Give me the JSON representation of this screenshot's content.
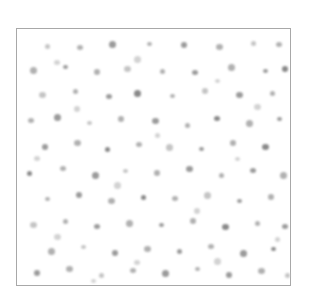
{
  "image": {
    "description": "Square frame filled with a random scatter of soft gray dots",
    "frame": {
      "left": 16,
      "top": 28,
      "width": 275,
      "height": 258,
      "border_color": "#a8a8a8"
    },
    "dot_colors": [
      "#c4c4c4",
      "#b0b0b0",
      "#9a9a9a",
      "#888888",
      "#d2d2d2"
    ],
    "dots": [
      [
        30,
        17,
        0
      ],
      [
        63,
        19,
        1
      ],
      [
        95,
        15,
        2
      ],
      [
        132,
        15,
        1
      ],
      [
        167,
        16,
        2
      ],
      [
        202,
        18,
        1
      ],
      [
        236,
        14,
        0
      ],
      [
        262,
        16,
        1
      ],
      [
        16,
        41,
        1
      ],
      [
        48,
        38,
        2
      ],
      [
        80,
        43,
        1
      ],
      [
        110,
        40,
        0
      ],
      [
        145,
        42,
        1
      ],
      [
        178,
        44,
        2
      ],
      [
        214,
        38,
        1
      ],
      [
        248,
        42,
        2
      ],
      [
        268,
        40,
        3
      ],
      [
        25,
        66,
        0
      ],
      [
        58,
        62,
        1
      ],
      [
        92,
        68,
        2
      ],
      [
        120,
        64,
        3
      ],
      [
        155,
        67,
        1
      ],
      [
        188,
        62,
        0
      ],
      [
        222,
        66,
        2
      ],
      [
        255,
        64,
        1
      ],
      [
        14,
        92,
        1
      ],
      [
        40,
        88,
        2
      ],
      [
        72,
        94,
        0
      ],
      [
        104,
        90,
        1
      ],
      [
        138,
        92,
        2
      ],
      [
        170,
        96,
        1
      ],
      [
        200,
        90,
        3
      ],
      [
        232,
        94,
        1
      ],
      [
        262,
        90,
        2
      ],
      [
        28,
        118,
        2
      ],
      [
        60,
        114,
        1
      ],
      [
        90,
        120,
        3
      ],
      [
        122,
        116,
        1
      ],
      [
        152,
        118,
        0
      ],
      [
        184,
        120,
        2
      ],
      [
        216,
        114,
        1
      ],
      [
        248,
        118,
        3
      ],
      [
        12,
        144,
        3
      ],
      [
        46,
        140,
        1
      ],
      [
        78,
        146,
        2
      ],
      [
        108,
        142,
        0
      ],
      [
        140,
        144,
        1
      ],
      [
        172,
        140,
        2
      ],
      [
        204,
        146,
        1
      ],
      [
        236,
        142,
        2
      ],
      [
        266,
        146,
        1
      ],
      [
        30,
        170,
        1
      ],
      [
        62,
        166,
        2
      ],
      [
        94,
        172,
        1
      ],
      [
        126,
        168,
        3
      ],
      [
        158,
        170,
        1
      ],
      [
        190,
        166,
        0
      ],
      [
        222,
        172,
        2
      ],
      [
        254,
        168,
        1
      ],
      [
        16,
        196,
        0
      ],
      [
        48,
        192,
        1
      ],
      [
        80,
        198,
        2
      ],
      [
        112,
        194,
        1
      ],
      [
        144,
        196,
        2
      ],
      [
        176,
        192,
        1
      ],
      [
        208,
        198,
        3
      ],
      [
        240,
        194,
        1
      ],
      [
        268,
        198,
        2
      ],
      [
        34,
        222,
        1
      ],
      [
        66,
        218,
        0
      ],
      [
        98,
        224,
        2
      ],
      [
        130,
        220,
        1
      ],
      [
        162,
        222,
        2
      ],
      [
        194,
        218,
        1
      ],
      [
        226,
        224,
        2
      ],
      [
        256,
        220,
        3
      ],
      [
        20,
        244,
        2
      ],
      [
        52,
        240,
        1
      ],
      [
        84,
        246,
        0
      ],
      [
        116,
        242,
        1
      ],
      [
        148,
        244,
        2
      ],
      [
        180,
        240,
        1
      ],
      [
        212,
        246,
        2
      ],
      [
        244,
        242,
        1
      ],
      [
        270,
        246,
        0
      ],
      [
        40,
        34,
        4
      ],
      [
        120,
        30,
        4
      ],
      [
        200,
        52,
        4
      ],
      [
        60,
        80,
        4
      ],
      [
        240,
        78,
        4
      ],
      [
        140,
        106,
        4
      ],
      [
        20,
        130,
        4
      ],
      [
        100,
        156,
        4
      ],
      [
        220,
        130,
        4
      ],
      [
        180,
        182,
        4
      ],
      [
        40,
        208,
        4
      ],
      [
        260,
        210,
        4
      ],
      [
        120,
        234,
        4
      ],
      [
        200,
        232,
        4
      ],
      [
        76,
        252,
        4
      ]
    ]
  }
}
